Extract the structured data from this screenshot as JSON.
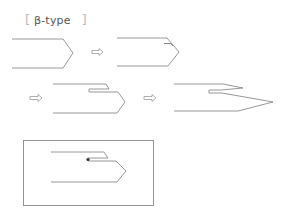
{
  "title": {
    "open_bracket": "[",
    "text": "β-type",
    "close_bracket": "]"
  },
  "colors": {
    "line": "#8c8c8c",
    "box": "#8a8a8a",
    "arrow": "#9a9a9a",
    "dot": "#333333"
  },
  "diagram": {
    "steps": [
      {
        "id": "step-1",
        "description": "initial folded strand (open hexagonal end)"
      },
      {
        "id": "step-2",
        "description": "inner flap begins at top fold"
      },
      {
        "id": "step-3",
        "description": "inner strand extends, offset double fold"
      },
      {
        "id": "step-4",
        "description": "elongated pointed tip"
      },
      {
        "id": "step-5",
        "description": "boxed result with anchor dot"
      }
    ],
    "arrows": [
      "arrow-1",
      "arrow-2",
      "arrow-3"
    ],
    "arrow_glyph": "⇨"
  },
  "caption": {
    "text": ""
  }
}
